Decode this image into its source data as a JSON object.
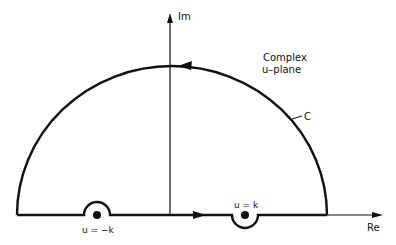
{
  "diagram": {
    "title_line1": "Complex",
    "title_line2": "u–plane",
    "axes": {
      "imaginary_label": "Im",
      "real_label": "Re"
    },
    "contour_label": "C",
    "poles": [
      {
        "label": "u = −k",
        "indent": "above"
      },
      {
        "label": "u = k",
        "indent": "below"
      }
    ],
    "colors": {
      "stroke": "#111111",
      "background": "#ffffff"
    }
  }
}
